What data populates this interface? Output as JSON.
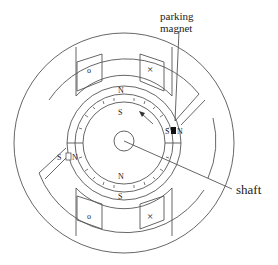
{
  "diagram": {
    "labels": {
      "parking_magnet_line1": "parking",
      "parking_magnet_line2": "magnet",
      "shaft": "shaft",
      "stator_top_pole": "N",
      "rotor_top_pole": "S",
      "rotor_bottom_pole": "N",
      "stator_bottom_pole": "S",
      "right_magnet_s": "S",
      "right_magnet_n": "N",
      "left_magnet_s": "S",
      "left_magnet_n": "N",
      "coil_dot": "o",
      "coil_cross": "×"
    },
    "colors": {
      "line": "#555555",
      "fill": "#000000"
    }
  }
}
